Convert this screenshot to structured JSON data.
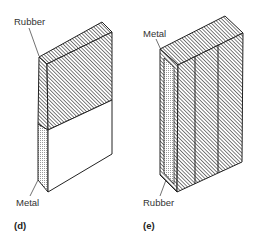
{
  "figures": [
    {
      "id": "d",
      "caption": "(d)",
      "labels": {
        "top": "Rubber",
        "bottom": "Metal"
      },
      "description": "Block with rubber (hatched) upper half and metal (plain) lower half"
    },
    {
      "id": "e",
      "caption": "(e)",
      "labels": {
        "top": "Metal",
        "bottom": "Rubber"
      },
      "description": "Rubber (hatched) block with three vertical panels and metal insert on side"
    }
  ],
  "colors": {
    "line": "#222222",
    "hatch": "#444444",
    "dots": "#999999",
    "background": "#ffffff"
  }
}
